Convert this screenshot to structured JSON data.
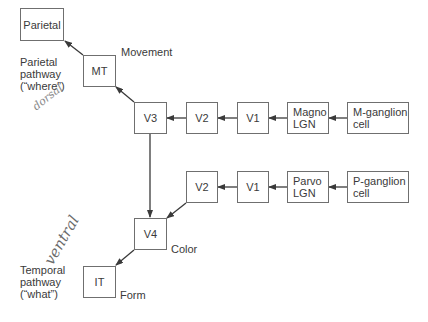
{
  "diagram": {
    "type": "flowchart",
    "colors": {
      "box_border": "#6f6f6f",
      "arrow": "#3a3a3a",
      "text": "#3a3a3a",
      "handwriting": "#6b6b6b"
    },
    "nodes": {
      "parietal": "Parietal",
      "mt": "MT",
      "v3": "V3",
      "v2_top": "V2",
      "v1_top": "V1",
      "magno_lgn": "Magno\nLGN",
      "m_ganglion": "M-ganglion\ncell",
      "v2_bottom": "V2",
      "v1_bottom": "V1",
      "parvo_lgn": "Parvo\nLGN",
      "p_ganglion": "P-ganglion\ncell",
      "v4": "V4",
      "it": "IT"
    },
    "labels": {
      "movement": "Movement",
      "color": "Color",
      "form": "Form",
      "parietal_pathway": "Parietal\npathway\n(“where”)",
      "temporal_pathway": "Temporal\npathway\n(“what”)"
    },
    "handwritten": {
      "dorsal": "dorsal",
      "ventral": "ventral"
    },
    "edges": [
      {
        "from": "M-ganglion cell",
        "to": "Magno LGN"
      },
      {
        "from": "Magno LGN",
        "to": "V1"
      },
      {
        "from": "V1",
        "to": "V2"
      },
      {
        "from": "V2",
        "to": "V3"
      },
      {
        "from": "V3",
        "to": "MT"
      },
      {
        "from": "MT",
        "to": "Parietal"
      },
      {
        "from": "V3",
        "to": "V4"
      },
      {
        "from": "P-ganglion cell",
        "to": "Parvo LGN"
      },
      {
        "from": "Parvo LGN",
        "to": "V1"
      },
      {
        "from": "V1",
        "to": "V2"
      },
      {
        "from": "V2",
        "to": "V4"
      },
      {
        "from": "V4",
        "to": "IT"
      }
    ]
  }
}
